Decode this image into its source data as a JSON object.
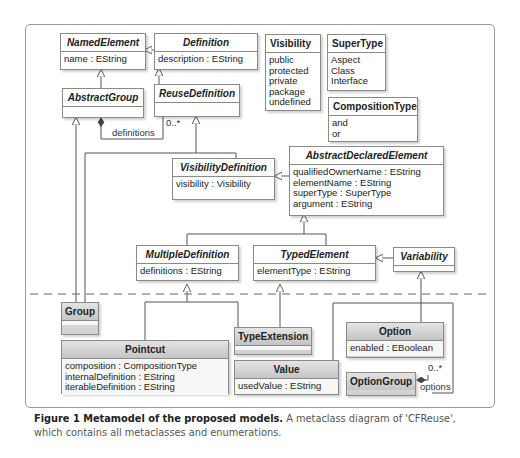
{
  "classes": {
    "named_element": {
      "name": "NamedElement",
      "attrs": [
        "name : EString"
      ]
    },
    "definition": {
      "name": "Definition",
      "attrs": [
        "description : EString"
      ]
    },
    "abstract_group": {
      "name": "AbstractGroup",
      "attrs": []
    },
    "reuse_definition": {
      "name": "ReuseDefinition",
      "attrs": []
    },
    "visibility_definition": {
      "name": "VisibilityDefinition",
      "attrs": [
        "visibility : Visibility"
      ]
    },
    "abstract_declared_element": {
      "name": "AbstractDeclaredElement",
      "attrs": [
        "qualifiedOwnerName : EString",
        "elementName : EString",
        "superType : SuperType",
        "argument : EString"
      ]
    },
    "multiple_definition": {
      "name": "MultipleDefinition",
      "attrs": [
        "definitions : EString"
      ]
    },
    "typed_element": {
      "name": "TypedElement",
      "attrs": [
        "elementType : EString"
      ]
    },
    "variability": {
      "name": "Variability",
      "attrs": []
    },
    "group": {
      "name": "Group",
      "attrs": []
    },
    "pointcut": {
      "name": "Pointcut",
      "attrs": [
        "composition : CompositionType",
        "internalDefinition : EString",
        "iterableDefinition : EString"
      ]
    },
    "type_extension": {
      "name": "TypeExtension",
      "attrs": []
    },
    "value": {
      "name": "Value",
      "attrs": [
        "usedValue : EString"
      ]
    },
    "option": {
      "name": "Option",
      "attrs": [
        "enabled : EBoolean"
      ]
    },
    "option_group": {
      "name": "OptionGroup",
      "attrs": []
    }
  },
  "enums": {
    "visibility": {
      "name": "Visibility",
      "literals": [
        "public",
        "protected",
        "private",
        "package",
        "undefined"
      ]
    },
    "super_type": {
      "name": "SuperType",
      "literals": [
        "Aspect",
        "Class",
        "Interface"
      ]
    },
    "composition_type": {
      "name": "CompositionType",
      "literals": [
        "and",
        "or"
      ]
    }
  },
  "associations": {
    "definitions": {
      "role": "definitions",
      "multiplicity": "0..*"
    },
    "options": {
      "role": "options",
      "multiplicity": "0..*"
    }
  },
  "caption": {
    "bold": "Figure 1 Metamodel of the proposed models.",
    "text": " A metaclass diagram of 'CFReuse', which contains all metaclasses and enumerations."
  }
}
